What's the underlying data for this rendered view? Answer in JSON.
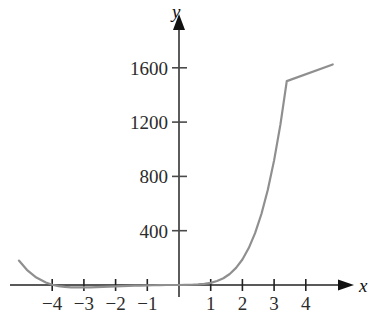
{
  "chart_data": {
    "type": "line",
    "title": "",
    "subtitle": "",
    "xlabel": "x",
    "ylabel": "y",
    "xlim": [
      -5.4,
      6.35
    ],
    "ylim": [
      -180,
      1840
    ],
    "grid": false,
    "legend": null,
    "annotations": [],
    "x_ticks": [
      -4,
      -3,
      -2,
      -1,
      1,
      2,
      3,
      4
    ],
    "x_tick_labels": [
      "−4",
      "−3",
      "−2",
      "−1",
      "1",
      "2",
      "3",
      "4"
    ],
    "y_ticks": [
      400,
      800,
      1200,
      1600
    ],
    "y_tick_labels": [
      "400",
      "800",
      "1200",
      "1600"
    ],
    "series": [
      {
        "name": "curve",
        "color": "#8f8f8f",
        "x": [
          -5.05,
          -4.8,
          -4.5,
          -4.2,
          -4.0,
          -3.8,
          -3.6,
          -3.4,
          -3.2,
          -3.0,
          -2.8,
          -2.6,
          -2.4,
          -2.2,
          -2.0,
          -1.8,
          -1.6,
          -1.4,
          -1.2,
          -1.0,
          -0.8,
          -0.6,
          -0.4,
          -0.2,
          0.0,
          0.2,
          0.4,
          0.6,
          0.8,
          1.0,
          1.2,
          1.4,
          1.6,
          1.8,
          2.0,
          2.2,
          2.4,
          2.6,
          2.8,
          3.0,
          3.2,
          3.4,
          3.6,
          3.8,
          4.0,
          4.2,
          4.4,
          4.6,
          4.85
        ],
        "y": [
          180,
          112,
          55,
          18,
          2,
          -8,
          -14,
          -17,
          -18,
          -18,
          -17,
          -16,
          -14,
          -12,
          -10,
          -8,
          -7,
          -5,
          -4,
          -3,
          -2,
          -1,
          0,
          0,
          0,
          1,
          2,
          4,
          8,
          16,
          29,
          50,
          81,
          126,
          188,
          272,
          382,
          523,
          700,
          918,
          1183,
          1502,
          1880,
          2325,
          2840,
          3436,
          4120,
          4900,
          1625
        ]
      }
    ]
  },
  "axes": {
    "x_axis_name": "x",
    "y_axis_name": "y",
    "x_axis_arrow": "arrow-right",
    "y_axis_arrow": "arrow-up"
  }
}
